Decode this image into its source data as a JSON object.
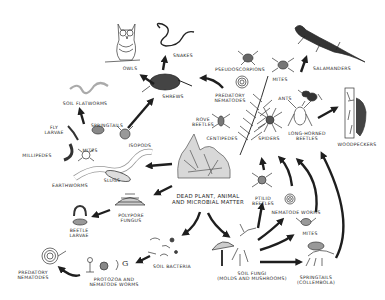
{
  "diagram": {
    "type": "food-web",
    "colors": {
      "ink": "#1e1e1e",
      "paper": "#ffffff",
      "label": "#2a2a2a"
    },
    "center": {
      "label_line1": "Dead plant, animal",
      "label_line2": "and microbial matter"
    },
    "nodes": {
      "owls": "Owls",
      "snakes": "Snakes",
      "shrews": "Shrews",
      "salamanders": "Salamanders",
      "pseudoscorpions": "Pseudoscorpions",
      "mites_top": "Mites",
      "predatory_nematodes_top_1": "Predatory",
      "predatory_nematodes_top_2": "Nematodes",
      "ants": "Ants",
      "soil_flatworms": "Soil flatworms",
      "springtails_small": "Springtails",
      "fly_larvae_1": "Fly",
      "fly_larvae_2": "Larvae",
      "isopods": "Isopods",
      "millipedes": "Millipedes",
      "mites_left": "Mites",
      "rove_beetles_1": "Rove",
      "rove_beetles_2": "Beetles",
      "centipedes": "Centipedes",
      "spiders": "Spiders",
      "long_horned_beetles_1": "Long-horned",
      "long_horned_beetles_2": "Beetles",
      "woodpeckers": "Woodpeckers",
      "earthworms": "Earthworms",
      "slugs": "Slugs",
      "polypore_fungus_1": "Polypore",
      "polypore_fungus_2": "Fungus",
      "beetle_larvae_1": "Beetle",
      "beetle_larvae_2": "Larvae",
      "ptilid_beetles_1": "Ptilid",
      "ptilid_beetles_2": "Beetles",
      "nematode_worms": "Nematode worms",
      "mites_right": "Mites",
      "soil_bacteria": "Soil bacteria",
      "soil_fungi_1": "Soil fungi",
      "soil_fungi_2": "(molds and mushrooms)",
      "springtails_1": "Springtails",
      "springtails_2": "(Collembola)",
      "protozoa_1": "Protozoa and",
      "protozoa_2": "nematode worms",
      "predatory_nematodes_bottom_1": "Predatory",
      "predatory_nematodes_bottom_2": "Nematodes"
    },
    "links": [
      {
        "from": "Dead plant, animal and microbial matter",
        "to": "Earthworms"
      },
      {
        "from": "Dead plant, animal and microbial matter",
        "to": "Polypore fungus"
      },
      {
        "from": "Dead plant, animal and microbial matter",
        "to": "Soil bacteria"
      },
      {
        "from": "Dead plant, animal and microbial matter",
        "to": "Soil fungi"
      },
      {
        "from": "Polypore fungus",
        "to": "Beetle larvae"
      },
      {
        "from": "Soil bacteria",
        "to": "Protozoa and nematode worms"
      },
      {
        "from": "Protozoa and nematode worms",
        "to": "Predatory nematodes"
      },
      {
        "from": "Soil fungi",
        "to": "Ptilid beetles"
      },
      {
        "from": "Soil fungi",
        "to": "Nematode worms"
      },
      {
        "from": "Soil fungi",
        "to": "Mites"
      },
      {
        "from": "Soil fungi",
        "to": "Springtails (Collembola)"
      },
      {
        "from": "Ptilid beetles",
        "to": "Spiders"
      },
      {
        "from": "Nematode worms",
        "to": "Long-horned beetles"
      },
      {
        "from": "Mites",
        "to": "Long-horned beetles"
      },
      {
        "from": "Springtails (Collembola)",
        "to": "Woodpeckers"
      },
      {
        "from": "Long-horned beetles",
        "to": "Woodpeckers"
      },
      {
        "from": "Springtails",
        "to": "Soil flatworms"
      },
      {
        "from": "Isopods",
        "to": "Shrews"
      },
      {
        "from": "Shrews",
        "to": "Owls"
      },
      {
        "from": "Shrews",
        "to": "Snakes"
      },
      {
        "from": "Predatory nematodes",
        "to": "Shrews"
      },
      {
        "from": "Mites",
        "to": "Salamanders"
      }
    ]
  }
}
